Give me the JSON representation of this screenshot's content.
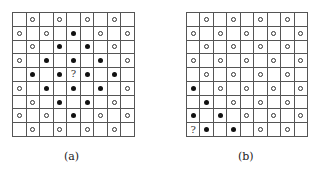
{
  "figure": {
    "legend": {
      "o": "open-circle",
      "x": "filled-circle",
      "?": "question-mark",
      "_": "empty"
    },
    "panels": [
      {
        "caption": "(a)",
        "rows": [
          "_o_o_o_o_",
          "o_o_x_o_o",
          "_o_x_x_o_",
          "o_x_x_x_o",
          "_x_x?x_x_",
          "o_x_x_x_o",
          "_o_x_x_o_",
          "o_o_x_o_o",
          "_o_o_o_o_"
        ]
      },
      {
        "caption": "(b)",
        "rows": [
          "_o_o_o_o_",
          "o_o_o_o_o",
          "_o_o_o_o_",
          "o_o_o_o_o",
          "_o_o_o_o_",
          "x_o_o_o_o",
          "_x_o_o_o_",
          "x_x_o_o_o",
          "?x_x_o_o_"
        ]
      }
    ],
    "question_mark": "?"
  }
}
